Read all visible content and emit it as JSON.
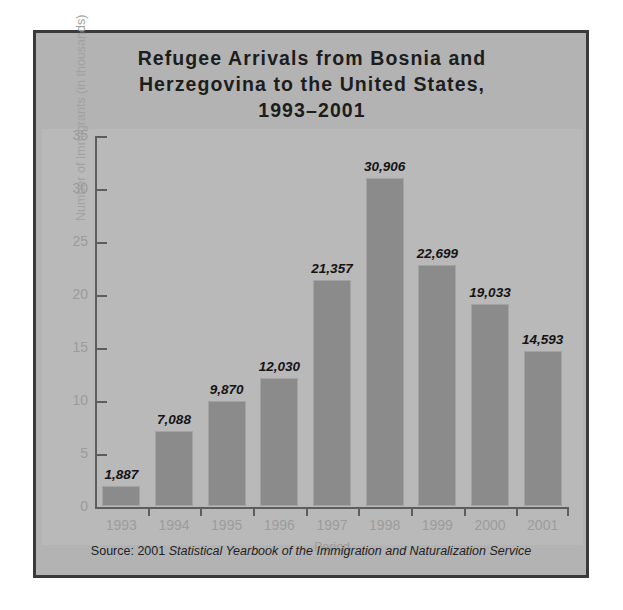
{
  "figure": {
    "title_lines": [
      "Refugee Arrivals from Bosnia and",
      "Herzegovina to the United States,",
      "1993–2001"
    ],
    "source_prefix": "Source: 2001 ",
    "source_italic": "Statistical Yearbook of the Immigration and Naturalization Service",
    "panel_color": "#b3b3b3",
    "plot_color": "#b9b9b9",
    "bar_color": "#8b8b8b",
    "frame_color": "#3a3a3a",
    "axis_color": "#5d5d5d",
    "tick_label_color": "#9c9c9c"
  },
  "chart_data": {
    "type": "bar",
    "title": "Refugee Arrivals from Bosnia and Herzegovina to the United States, 1993–2001",
    "xlabel": "Period",
    "ylabel": "Number of Immigrants (in thousands)",
    "categories": [
      "1993",
      "1994",
      "1995",
      "1996",
      "1997",
      "1998",
      "1999",
      "2000",
      "2001"
    ],
    "values": [
      1.887,
      7.088,
      9.87,
      12.03,
      21.357,
      30.906,
      22.699,
      19.033,
      14.593
    ],
    "data_labels": [
      "1,887",
      "7,088",
      "9,870",
      "12,030",
      "21,357",
      "30,906",
      "22,699",
      "19,033",
      "14,593"
    ],
    "ylim": [
      0,
      35
    ],
    "yticks": [
      0,
      5,
      10,
      15,
      20,
      25,
      30,
      35
    ],
    "ytick_labels": [
      "0",
      "5",
      "10",
      "15",
      "20",
      "25",
      "30",
      "35"
    ],
    "grid": false,
    "legend": false,
    "units": "thousands"
  }
}
